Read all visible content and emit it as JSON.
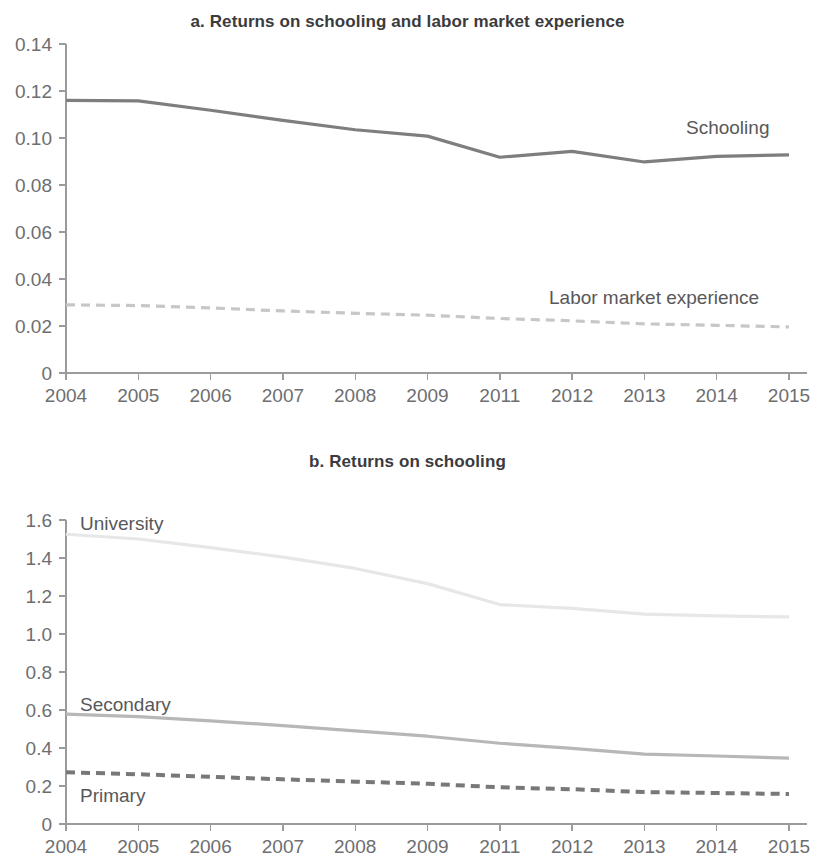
{
  "figure": {
    "panels": [
      {
        "id": "a",
        "title": "a. Returns on schooling and labor market experience"
      },
      {
        "id": "b",
        "title": "b. Returns on schooling"
      }
    ]
  },
  "chart_data": [
    {
      "type": "line",
      "title": "a. Returns on schooling and labor market experience",
      "xlabel": "",
      "ylabel": "",
      "categories": [
        "2004",
        "2005",
        "2006",
        "2007",
        "2008",
        "2009",
        "2011",
        "2012",
        "2013",
        "2014",
        "2015"
      ],
      "ylim": [
        0,
        0.14
      ],
      "yticks": [
        "0",
        "0.02",
        "0.04",
        "0.06",
        "0.08",
        "0.10",
        "0.12",
        "0.14"
      ],
      "ytick_values": [
        0,
        0.02,
        0.04,
        0.06,
        0.08,
        0.1,
        0.12,
        0.14
      ],
      "grid": false,
      "legend_position": "inline-right",
      "series": [
        {
          "name": "Schooling",
          "color": "#7d7e80",
          "style": "solid",
          "width": 3.2,
          "label_x": "2014",
          "values": [
            0.116,
            0.1158,
            0.1118,
            0.1075,
            0.1035,
            0.1008,
            0.0918,
            0.0943,
            0.0898,
            0.0922,
            0.0928
          ]
        },
        {
          "name": "Labor market experience",
          "color": "#c6c7c9",
          "style": "dashed",
          "width": 3.2,
          "label_x": "2013",
          "values": [
            0.029,
            0.0287,
            0.0277,
            0.0264,
            0.0254,
            0.0246,
            0.0232,
            0.0222,
            0.0209,
            0.0203,
            0.0196
          ]
        }
      ]
    },
    {
      "type": "line",
      "title": "b. Returns on schooling",
      "xlabel": "",
      "ylabel": "",
      "categories": [
        "2004",
        "2005",
        "2006",
        "2007",
        "2008",
        "2009",
        "2011",
        "2012",
        "2013",
        "2014",
        "2015"
      ],
      "ylim": [
        0,
        1.6
      ],
      "yticks": [
        "0",
        "0.2",
        "0.4",
        "0.6",
        "0.8",
        "1.0",
        "1.2",
        "1.4",
        "1.6"
      ],
      "ytick_values": [
        0,
        0.2,
        0.4,
        0.6,
        0.8,
        1.0,
        1.2,
        1.4,
        1.6
      ],
      "grid": false,
      "legend_position": "inline-left",
      "series": [
        {
          "name": "University",
          "color": "#e6e7e8",
          "style": "solid",
          "width": 3.2,
          "label_x": "2004",
          "values": [
            1.525,
            1.5,
            1.455,
            1.405,
            1.345,
            1.265,
            1.155,
            1.135,
            1.105,
            1.095,
            1.09
          ]
        },
        {
          "name": "Secondary",
          "color": "#b6b7b9",
          "style": "solid",
          "width": 3.2,
          "label_x": "2004",
          "values": [
            0.578,
            0.565,
            0.543,
            0.518,
            0.49,
            0.462,
            0.425,
            0.398,
            0.368,
            0.358,
            0.347
          ]
        },
        {
          "name": "Primary",
          "color": "#77787a",
          "style": "dashed",
          "width": 4.0,
          "label_x": "2004",
          "values": [
            0.272,
            0.262,
            0.248,
            0.235,
            0.223,
            0.212,
            0.193,
            0.183,
            0.168,
            0.163,
            0.158
          ]
        }
      ]
    }
  ]
}
